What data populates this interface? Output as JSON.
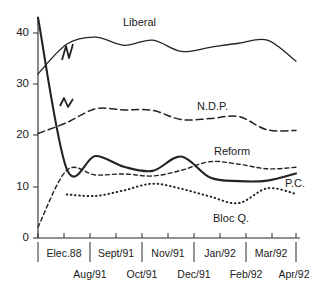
{
  "chart_data": {
    "type": "line",
    "title": "",
    "xlabel": "",
    "ylabel": "",
    "ylim": [
      0,
      44
    ],
    "yticks": [
      0,
      10,
      20,
      30,
      40
    ],
    "ytick_labels": [
      "0",
      "10",
      "20",
      "30",
      "40"
    ],
    "grid": false,
    "legend_position": "inline-annotations",
    "x_axis_note": "Election 1988 result at far left, then monthly polls Aug/91 through Apr/92; axis break between 1988 and Aug/91",
    "x_tick_labels_upper": [
      "Elec.88",
      "Sept/91",
      "Nov/91",
      "Jan/92",
      "Mar/92"
    ],
    "x_tick_labels_lower": [
      "Aug/91",
      "Oct/91",
      "Dec/91",
      "Feb/92",
      "Apr/92"
    ],
    "x": [
      "Elec.88",
      "Aug/91",
      "Sept/91",
      "Oct/91",
      "Nov/91",
      "Dec/91",
      "Jan/92",
      "Feb/92",
      "Mar/92",
      "Apr/92"
    ],
    "series": [
      {
        "name": "Liberal",
        "style": "solid",
        "label": "Liberal",
        "values": [
          32.0,
          37.8,
          39.2,
          37.6,
          38.6,
          36.4,
          37.2,
          38.0,
          38.6,
          34.5
        ]
      },
      {
        "name": "N.D.P.",
        "style": "dashed-long",
        "label": "N.D.P.",
        "values": [
          20.4,
          22.5,
          25.2,
          25.0,
          24.9,
          23.1,
          23.3,
          23.7,
          21.1,
          21.0
        ]
      },
      {
        "name": "Reform",
        "style": "dashed-short",
        "label": "Reform",
        "values": [
          2.1,
          13.2,
          12.3,
          12.5,
          12.1,
          13.2,
          14.9,
          14.4,
          13.5,
          13.8
        ]
      },
      {
        "name": "P.C.",
        "style": "solid-heavy",
        "label": "P.C.",
        "values": [
          43.0,
          13.5,
          16.0,
          13.9,
          13.1,
          15.9,
          11.8,
          11.1,
          11.2,
          12.6
        ]
      },
      {
        "name": "Bloc Q.",
        "style": "dotted",
        "label": "Bloc Q.",
        "values": [
          null,
          8.5,
          8.2,
          9.3,
          10.6,
          9.6,
          8.1,
          6.8,
          9.7,
          8.6
        ]
      }
    ],
    "colors": {
      "axis": "#2b2b2b",
      "lines": "#232323",
      "background": "#ffffff"
    }
  },
  "annotations": {
    "liberal_label": "Liberal",
    "ndp_label": "N.D.P.",
    "reform_label": "Reform",
    "pc_label": "P.C.",
    "bloc_label": "Bloc Q."
  }
}
